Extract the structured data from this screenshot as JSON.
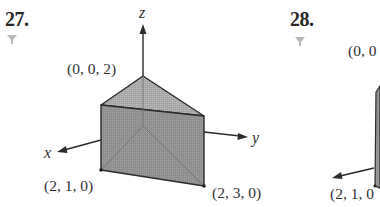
{
  "problems": [
    {
      "number": "27.",
      "icon": "funnel-icon",
      "figure": {
        "type": "triangular-prism",
        "axes": {
          "x": "x",
          "y": "y",
          "z": "z"
        },
        "points": [
          {
            "label": "(0, 0, 2)"
          },
          {
            "label": "(2, 1, 0)"
          },
          {
            "label": "(2, 3, 0)"
          }
        ]
      }
    },
    {
      "number": "28.",
      "icon": "funnel-icon",
      "figure": {
        "partial": true,
        "points": [
          {
            "label": "(0, 0"
          },
          {
            "label": "(2, 1, 0"
          }
        ]
      }
    }
  ],
  "colors": {
    "face_fill": "#8c8c8c",
    "top_fill": "#a8a8a8",
    "line": "#2b2b2b",
    "icon": "#b5b5b5"
  }
}
